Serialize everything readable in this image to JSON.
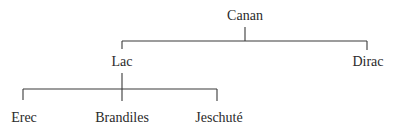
{
  "diagram": {
    "type": "family-tree",
    "root": {
      "label": "Canan",
      "children": [
        {
          "label": "Lac",
          "children": [
            {
              "label": "Erec"
            },
            {
              "label": "Brandiles"
            },
            {
              "label": "Jeschuté"
            }
          ]
        },
        {
          "label": "Dirac"
        }
      ]
    }
  },
  "nodes": {
    "canan": "Canan",
    "lac": "Lac",
    "dirac": "Dirac",
    "erec": "Erec",
    "brandiles": "Brandiles",
    "jeschute": "Jeschuté"
  },
  "colors": {
    "line": "#3a3a3a",
    "text": "#2a2a2a",
    "background": "#ffffff"
  }
}
